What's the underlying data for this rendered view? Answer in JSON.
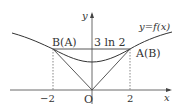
{
  "diagram": {
    "curve_label": "y=f(x)",
    "axis_x_label": "x",
    "axis_y_label": "y",
    "origin_label": "O",
    "point_left_label": "B(A)",
    "point_right_label": "A(B)",
    "segment_label": "3 ln 2",
    "tick_neg": "−2",
    "tick_pos": "2"
  }
}
